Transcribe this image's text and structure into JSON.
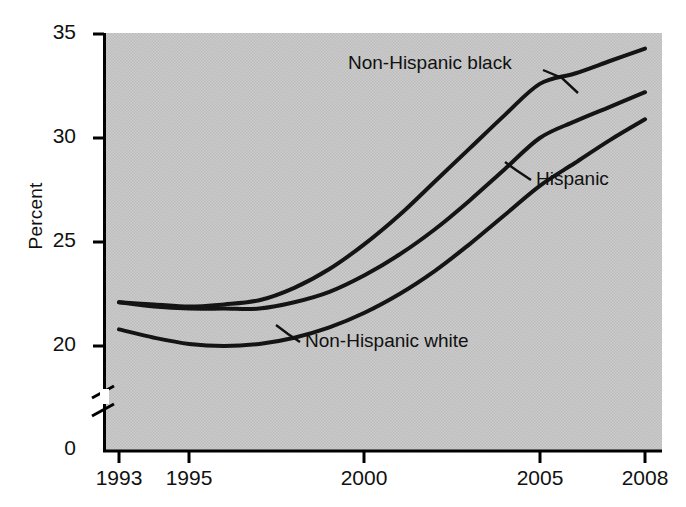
{
  "chart_data": {
    "type": "line",
    "title": "",
    "subtitle": "",
    "xlabel": "",
    "ylabel": "Percent",
    "xlim": [
      1993,
      2008
    ],
    "ylim": [
      0,
      35
    ],
    "y_axis_break": true,
    "y_break_between": [
      0,
      19
    ],
    "grid": false,
    "legend_position": "inline-annotations",
    "xticks": [
      "1993",
      "1995",
      "2000",
      "2005",
      "2008"
    ],
    "xtick_values": [
      1993,
      1995,
      2000,
      2005,
      2008
    ],
    "yticks": [
      "0",
      "20",
      "25",
      "30",
      "35"
    ],
    "ytick_values": [
      0,
      20,
      25,
      30,
      35
    ],
    "x": [
      1993,
      1994,
      1995,
      1996,
      1997,
      1998,
      1999,
      2000,
      2001,
      2002,
      2003,
      2004,
      2005,
      2006,
      2007,
      2008
    ],
    "series": [
      {
        "name": "Non-Hispanic black",
        "label": "Non-Hispanic black",
        "values": [
          22.1,
          22.0,
          21.9,
          22.0,
          22.2,
          22.8,
          23.7,
          24.9,
          26.3,
          27.9,
          29.5,
          31.1,
          32.6,
          33.1,
          33.7,
          34.3
        ]
      },
      {
        "name": "Hispanic",
        "label": "Hispanic",
        "values": [
          22.1,
          21.9,
          21.8,
          21.8,
          21.8,
          22.1,
          22.6,
          23.4,
          24.4,
          25.6,
          27.0,
          28.5,
          30.0,
          30.8,
          31.5,
          32.2
        ]
      },
      {
        "name": "Non-Hispanic white",
        "label": "Non-Hispanic white",
        "values": [
          20.8,
          20.4,
          20.1,
          20.0,
          20.1,
          20.4,
          20.9,
          21.6,
          22.5,
          23.6,
          24.9,
          26.3,
          27.7,
          28.8,
          29.9,
          30.9
        ]
      }
    ],
    "annotations": [
      {
        "text": "Non-Hispanic black",
        "series": "Non-Hispanic black"
      },
      {
        "text": "Hispanic",
        "series": "Hispanic"
      },
      {
        "text": "Non-Hispanic white",
        "series": "Non-Hispanic white"
      }
    ],
    "colors": {
      "line": "#141414",
      "plot_background": "#c9c9c9",
      "axis": "#000000",
      "text": "#111111"
    }
  },
  "axis": {
    "y_label": "Percent",
    "y_ticks": [
      "35",
      "30",
      "25",
      "20",
      "0"
    ],
    "x_ticks": [
      "1993",
      "1995",
      "2000",
      "2005",
      "2008"
    ]
  },
  "annotations": {
    "nh_black": "Non-Hispanic black",
    "hispanic": "Hispanic",
    "nh_white": "Non-Hispanic white"
  }
}
